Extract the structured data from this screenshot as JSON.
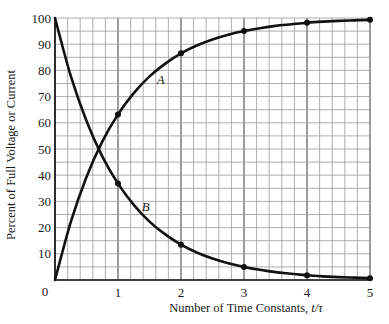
{
  "chart_data": {
    "type": "line",
    "title": "",
    "xlabel": "Number of Time Constants, t/τ",
    "xlabel_text": "Number of Time Constants, ",
    "xlabel_math": "t/τ",
    "ylabel": "Percent of Full Voltage or Current",
    "xlim": [
      0,
      5
    ],
    "ylim": [
      0,
      100
    ],
    "x_ticks": [
      0,
      1,
      2,
      3,
      4,
      5
    ],
    "y_ticks": [
      0,
      10,
      20,
      30,
      40,
      50,
      60,
      70,
      80,
      90,
      100
    ],
    "tick_labels": {
      "origin": "0",
      "x": [
        "1",
        "2",
        "3",
        "4",
        "5"
      ],
      "y": [
        "10",
        "20",
        "30",
        "40",
        "50",
        "60",
        "70",
        "80",
        "90",
        "100"
      ]
    },
    "grid": {
      "on": true,
      "x_minor_step": 0.2,
      "y_minor_step": 5,
      "x_major_step": 1
    },
    "legend": {
      "position": "inline-annotations"
    },
    "x": [
      0,
      0.25,
      0.5,
      0.75,
      1,
      1.25,
      1.5,
      1.75,
      2,
      2.25,
      2.5,
      2.75,
      3,
      3.25,
      3.5,
      3.75,
      4,
      4.25,
      4.5,
      4.75,
      5
    ],
    "series": [
      {
        "name": "A",
        "description": "rising curve 100(1 - e^(-t/τ))",
        "values": [
          0,
          22.1,
          39.3,
          52.8,
          63.2,
          71.3,
          77.7,
          82.6,
          86.5,
          89.5,
          91.8,
          93.6,
          95.0,
          96.1,
          97.0,
          97.6,
          98.2,
          98.6,
          98.9,
          99.1,
          99.3
        ],
        "markers": {
          "x": [
            1,
            2,
            3,
            4,
            5
          ],
          "y": [
            63.2,
            86.5,
            95.0,
            98.2,
            99.3
          ]
        }
      },
      {
        "name": "B",
        "description": "decaying curve 100 e^(-t/τ)",
        "values": [
          100,
          77.9,
          60.7,
          47.2,
          36.8,
          28.7,
          22.3,
          17.4,
          13.5,
          10.5,
          8.2,
          6.4,
          5.0,
          3.9,
          3.0,
          2.4,
          1.8,
          1.4,
          1.1,
          0.9,
          0.7
        ],
        "markers": {
          "x": [
            1,
            2,
            3,
            4,
            5
          ],
          "y": [
            36.8,
            13.5,
            5.0,
            1.8,
            0.7
          ]
        }
      }
    ],
    "annotations": [
      {
        "text": "A",
        "x": 1.68,
        "y": 76.7
      },
      {
        "text": "B",
        "x": 1.44,
        "y": 27.9
      }
    ],
    "colors": {
      "curve": "#111111",
      "grid": "#9a9a9a",
      "grid_major": "#4a4a4a",
      "background": "#ffffff"
    }
  }
}
